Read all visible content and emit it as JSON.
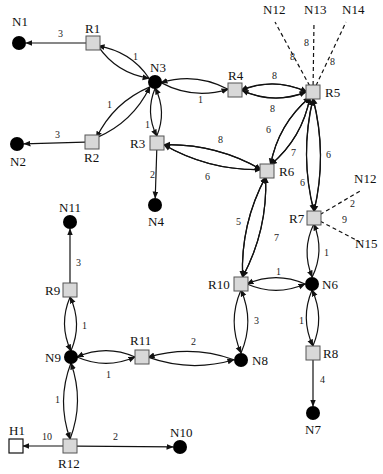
{
  "diagram": {
    "type": "network-topology",
    "nodes": [
      {
        "id": "N1",
        "kind": "node",
        "x": 19,
        "y": 43,
        "label": "N1",
        "lx": 12,
        "ly": 26
      },
      {
        "id": "N2",
        "kind": "node",
        "x": 17,
        "y": 144,
        "label": "N2",
        "lx": 10,
        "ly": 166
      },
      {
        "id": "N3",
        "kind": "node",
        "x": 155,
        "y": 82,
        "label": "N3",
        "lx": 150,
        "ly": 72
      },
      {
        "id": "N4",
        "kind": "node",
        "x": 155,
        "y": 205,
        "label": "N4",
        "lx": 148,
        "ly": 226
      },
      {
        "id": "N6",
        "kind": "node",
        "x": 312,
        "y": 284,
        "label": "N6",
        "lx": 322,
        "ly": 289
      },
      {
        "id": "N7",
        "kind": "node",
        "x": 313,
        "y": 413,
        "label": "N7",
        "lx": 305,
        "ly": 434
      },
      {
        "id": "N8",
        "kind": "node",
        "x": 241,
        "y": 360,
        "label": "N8",
        "lx": 252,
        "ly": 365
      },
      {
        "id": "N9",
        "kind": "node",
        "x": 71,
        "y": 357,
        "label": "N9",
        "lx": 45,
        "ly": 362
      },
      {
        "id": "N10",
        "kind": "node",
        "x": 180,
        "y": 447,
        "label": "N10",
        "lx": 170,
        "ly": 437
      },
      {
        "id": "N11",
        "kind": "node",
        "x": 70,
        "y": 222,
        "label": "N11",
        "lx": 59,
        "ly": 212
      },
      {
        "id": "R1",
        "kind": "router",
        "x": 93,
        "y": 43,
        "label": "R1",
        "lx": 85,
        "ly": 33
      },
      {
        "id": "R2",
        "kind": "router",
        "x": 92,
        "y": 142,
        "label": "R2",
        "lx": 84,
        "ly": 162
      },
      {
        "id": "R3",
        "kind": "router",
        "x": 157,
        "y": 143,
        "label": "R3",
        "lx": 130,
        "ly": 148
      },
      {
        "id": "R4",
        "kind": "router",
        "x": 235,
        "y": 90,
        "label": "R4",
        "lx": 228,
        "ly": 80
      },
      {
        "id": "R5",
        "kind": "router",
        "x": 313,
        "y": 92,
        "label": "R5",
        "lx": 325,
        "ly": 97
      },
      {
        "id": "R6",
        "kind": "router",
        "x": 267,
        "y": 171,
        "label": "R6",
        "lx": 279,
        "ly": 176
      },
      {
        "id": "R7",
        "kind": "router",
        "x": 314,
        "y": 218,
        "label": "R7",
        "lx": 289,
        "ly": 223
      },
      {
        "id": "R8",
        "kind": "router",
        "x": 313,
        "y": 353,
        "label": "R8",
        "lx": 323,
        "ly": 358
      },
      {
        "id": "R9",
        "kind": "router",
        "x": 70,
        "y": 290,
        "label": "R9",
        "lx": 45,
        "ly": 295
      },
      {
        "id": "R10",
        "kind": "router",
        "x": 241,
        "y": 284,
        "label": "R10",
        "lx": 208,
        "ly": 289
      },
      {
        "id": "R11",
        "kind": "router",
        "x": 142,
        "y": 357,
        "label": "R11",
        "lx": 130,
        "ly": 345
      },
      {
        "id": "R12",
        "kind": "router",
        "x": 70,
        "y": 446,
        "label": "R12",
        "lx": 58,
        "ly": 468
      },
      {
        "id": "H1",
        "kind": "host",
        "x": 16,
        "y": 446,
        "label": "H1",
        "lx": 9,
        "ly": 435
      },
      {
        "id": "N12a",
        "kind": "label",
        "x": 0,
        "y": 0,
        "label": "N12",
        "lx": 263,
        "ly": 14
      },
      {
        "id": "N13",
        "kind": "label",
        "x": 0,
        "y": 0,
        "label": "N13",
        "lx": 304,
        "ly": 14
      },
      {
        "id": "N14",
        "kind": "label",
        "x": 0,
        "y": 0,
        "label": "N14",
        "lx": 342,
        "ly": 14
      },
      {
        "id": "N12b",
        "kind": "label",
        "x": 0,
        "y": 0,
        "label": "N12",
        "lx": 354,
        "ly": 183
      },
      {
        "id": "N15",
        "kind": "label",
        "x": 0,
        "y": 0,
        "label": "N15",
        "lx": 355,
        "ly": 248
      }
    ],
    "edges": [
      {
        "from": "R1",
        "to": "N1",
        "weight": "3",
        "style": "arrow",
        "wx": 58,
        "wy": 37
      },
      {
        "from": "R2",
        "to": "N2",
        "weight": "3",
        "style": "arrow",
        "wx": 55,
        "wy": 138
      },
      {
        "from": "R1",
        "to": "N3",
        "weight": "1",
        "style": "bidir",
        "wx": 133,
        "wy": 60
      },
      {
        "from": "R2",
        "to": "N3",
        "weight": "1",
        "style": "bidir",
        "wx": 107,
        "wy": 108
      },
      {
        "from": "N3",
        "to": "R3",
        "weight": "1",
        "style": "bidir",
        "wx": 145,
        "wy": 128
      },
      {
        "from": "N3",
        "to": "R4",
        "weight": "1",
        "style": "bidir",
        "wx": 198,
        "wy": 103
      },
      {
        "from": "R4",
        "to": "R5",
        "weight": "8",
        "style": "bidir",
        "wx": 272,
        "wy": 79
      },
      {
        "from": "R5",
        "to": "R4",
        "weight": "8",
        "style": "bidir",
        "wx": 270,
        "wy": 112
      },
      {
        "from": "R3",
        "to": "N4",
        "weight": "2",
        "style": "arrow",
        "wx": 150,
        "wy": 178
      },
      {
        "from": "R6",
        "to": "R3",
        "weight": "8",
        "style": "bidir",
        "wx": 218,
        "wy": 143
      },
      {
        "from": "R6",
        "to": "R3",
        "weight": "6",
        "style": "bidir",
        "wx": 205,
        "wy": 180
      },
      {
        "from": "R5",
        "to": "R6",
        "weight": "6",
        "style": "bidir",
        "wx": 266,
        "wy": 133
      },
      {
        "from": "R5",
        "to": "R6",
        "weight": "7",
        "style": "bidir",
        "wx": 291,
        "wy": 156
      },
      {
        "from": "R5",
        "to": "R7",
        "weight": "6",
        "style": "bidir",
        "wx": 326,
        "wy": 158
      },
      {
        "from": "R7",
        "to": "R5",
        "weight": "6",
        "style": "bidir",
        "wx": 300,
        "wy": 186
      },
      {
        "from": "R6",
        "to": "R10",
        "weight": "5",
        "style": "bidir",
        "wx": 236,
        "wy": 225
      },
      {
        "from": "R6",
        "to": "R10",
        "weight": "7",
        "style": "bidir",
        "wx": 274,
        "wy": 241
      },
      {
        "from": "R10",
        "to": "N6",
        "weight": "1",
        "style": "bidir",
        "wx": 276,
        "wy": 275
      },
      {
        "from": "R7",
        "to": "N6",
        "weight": "1",
        "style": "bidir",
        "wx": 324,
        "wy": 256
      },
      {
        "from": "R10",
        "to": "N8",
        "weight": "3",
        "style": "bidir",
        "wx": 254,
        "wy": 324
      },
      {
        "from": "N6",
        "to": "R8",
        "weight": "1",
        "style": "bidir",
        "wx": 299,
        "wy": 324
      },
      {
        "from": "R8",
        "to": "N7",
        "weight": "4",
        "style": "arrow",
        "wx": 320,
        "wy": 383
      },
      {
        "from": "R11",
        "to": "N8",
        "weight": "2",
        "style": "bidir",
        "wx": 191,
        "wy": 345
      },
      {
        "from": "N9",
        "to": "R11",
        "weight": "1",
        "style": "bidir",
        "wx": 106,
        "wy": 378
      },
      {
        "from": "R9",
        "to": "N11",
        "weight": "3",
        "style": "arrow",
        "wx": 76,
        "wy": 266
      },
      {
        "from": "N9",
        "to": "R9",
        "weight": "1",
        "style": "bidir",
        "wx": 82,
        "wy": 329
      },
      {
        "from": "N9",
        "to": "R12",
        "weight": "1",
        "style": "bidir",
        "wx": 55,
        "wy": 403
      },
      {
        "from": "R12",
        "to": "H1",
        "weight": "10",
        "style": "arrow",
        "wx": 42,
        "wy": 440
      },
      {
        "from": "R12",
        "to": "N10",
        "weight": "2",
        "style": "arrow",
        "wx": 113,
        "wy": 440
      },
      {
        "from": "R5",
        "to": "N12a",
        "weight": "8",
        "style": "dashed",
        "wx": 290,
        "wy": 60
      },
      {
        "from": "R5",
        "to": "N13",
        "weight": "8",
        "style": "dashed",
        "wx": 304,
        "wy": 46
      },
      {
        "from": "R5",
        "to": "N14",
        "weight": "8",
        "style": "dashed",
        "wx": 330,
        "wy": 65
      },
      {
        "from": "R7",
        "to": "N12b",
        "weight": "2",
        "style": "dashed",
        "wx": 350,
        "wy": 207
      },
      {
        "from": "R7",
        "to": "N15",
        "weight": "9",
        "style": "dashed",
        "wx": 342,
        "wy": 223
      }
    ]
  }
}
